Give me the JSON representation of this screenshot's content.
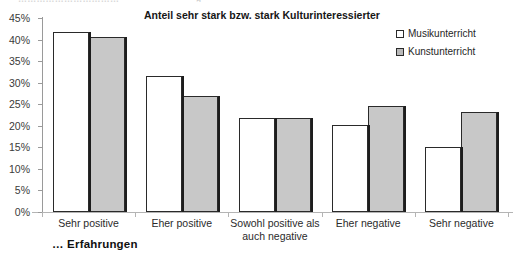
{
  "top_clipped_text": "……………………………",
  "top_clipped_glyph": "g",
  "axis_note": "… Erfahrungen",
  "chart_data": {
    "type": "bar",
    "title": "Anteil sehr stark bzw. stark Kulturinteressierter",
    "xlabel": "",
    "ylabel": "",
    "ylim": [
      0,
      45
    ],
    "ytick_step": 5,
    "ytick_labels": [
      "0%",
      "5%",
      "10%",
      "15%",
      "20%",
      "25%",
      "30%",
      "35%",
      "40%",
      "45%"
    ],
    "ytick_values": [
      0,
      5,
      10,
      15,
      20,
      25,
      30,
      35,
      40,
      45
    ],
    "grid": false,
    "legend_position": "top-right",
    "categories": [
      "Sehr positive",
      "Eher positive",
      "Sowohl positive als auch negative",
      "Eher negative",
      "Sehr negative"
    ],
    "series": [
      {
        "name": "Musikunterricht",
        "color": "#ffffff",
        "values": [
          41.7,
          31.5,
          21.7,
          20.2,
          15.0
        ]
      },
      {
        "name": "Kunstunterricht",
        "color": "#c8c8c8",
        "values": [
          40.6,
          26.8,
          21.7,
          24.6,
          23.1
        ]
      }
    ]
  }
}
